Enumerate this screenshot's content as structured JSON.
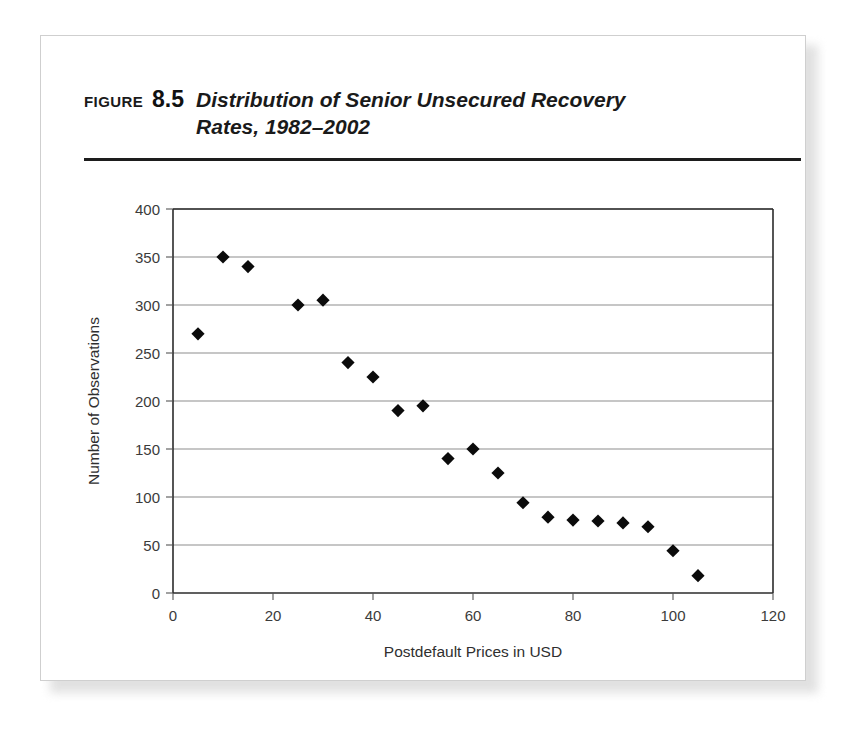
{
  "figure": {
    "label": "FIGURE",
    "number": "8.5",
    "title": "Distribution of Senior Unsecured Recovery Rates, 1982–2002"
  },
  "chart_data": {
    "type": "scatter",
    "title": "Distribution of Senior Unsecured Recovery Rates, 1982–2002",
    "xlabel": "Postdefault Prices in USD",
    "ylabel": "Number of Observations",
    "xlim": [
      0,
      120
    ],
    "ylim": [
      0,
      400
    ],
    "xticks": [
      0,
      20,
      40,
      60,
      80,
      100,
      120
    ],
    "yticks": [
      0,
      50,
      100,
      150,
      200,
      250,
      300,
      350,
      400
    ],
    "xtick_labels": [
      "0",
      "20",
      "40",
      "60",
      "80",
      "100",
      "120"
    ],
    "ytick_labels": [
      "0",
      "50",
      "100",
      "150",
      "200",
      "250",
      "300",
      "350",
      "400"
    ],
    "grid": "horizontal",
    "legend": "none",
    "marker": "diamond",
    "marker_color": "#0b0b0b",
    "x": [
      5,
      10,
      15,
      25,
      30,
      35,
      40,
      45,
      50,
      55,
      60,
      65,
      70,
      75,
      80,
      85,
      90,
      95,
      100,
      105
    ],
    "y": [
      270,
      350,
      340,
      300,
      305,
      240,
      225,
      190,
      195,
      140,
      150,
      125,
      94,
      79,
      76,
      75,
      73,
      69,
      44,
      18
    ],
    "points": [
      {
        "x": 5,
        "y": 270
      },
      {
        "x": 10,
        "y": 350
      },
      {
        "x": 15,
        "y": 340
      },
      {
        "x": 25,
        "y": 300
      },
      {
        "x": 30,
        "y": 305
      },
      {
        "x": 35,
        "y": 240
      },
      {
        "x": 40,
        "y": 225
      },
      {
        "x": 45,
        "y": 190
      },
      {
        "x": 50,
        "y": 195
      },
      {
        "x": 55,
        "y": 140
      },
      {
        "x": 60,
        "y": 150
      },
      {
        "x": 65,
        "y": 125
      },
      {
        "x": 70,
        "y": 94
      },
      {
        "x": 75,
        "y": 79
      },
      {
        "x": 80,
        "y": 76
      },
      {
        "x": 85,
        "y": 75
      },
      {
        "x": 90,
        "y": 73
      },
      {
        "x": 95,
        "y": 69
      },
      {
        "x": 100,
        "y": 44
      },
      {
        "x": 105,
        "y": 18
      }
    ]
  }
}
